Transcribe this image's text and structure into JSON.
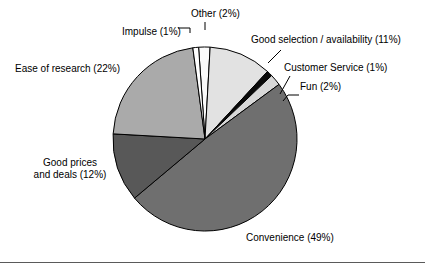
{
  "figure": {
    "background_color": "#ffffff",
    "has_footer_rule": true,
    "footer_rule_color": "#5a5a5a"
  },
  "chart_data": {
    "type": "pie",
    "title": "",
    "xlabel": "",
    "ylabel": "",
    "legend_position": "none",
    "grid": false,
    "label_format": "{name} ({value}%)",
    "total": 100,
    "start_angle_deg": -4,
    "direction": "clockwise",
    "center": {
      "x": 205,
      "y": 139
    },
    "radius": 92,
    "categories": [
      "Other",
      "Good selection / availability",
      "Customer Service",
      "Fun",
      "Convenience",
      "Good prices and deals",
      "Ease of research",
      "Impulse"
    ],
    "values": [
      2,
      11,
      1,
      2,
      49,
      12,
      22,
      1
    ],
    "colors": [
      "#fafafa",
      "#e2e2e2",
      "#0a0a0a",
      "#d8d8d8",
      "#6f6f6f",
      "#585858",
      "#aaaaaa",
      "#ffffff"
    ],
    "slice_edge_color": "#000000",
    "slices": [
      {
        "name": "Other",
        "value": 2,
        "color": "#fafafa",
        "label": "Other (2%)"
      },
      {
        "name": "Good selection / availability",
        "value": 11,
        "color": "#e2e2e2",
        "label": "Good selection / availability (11%)"
      },
      {
        "name": "Customer Service",
        "value": 1,
        "color": "#0a0a0a",
        "label": "Customer Service (1%)"
      },
      {
        "name": "Fun",
        "value": 2,
        "color": "#d8d8d8",
        "label": "Fun (2%)"
      },
      {
        "name": "Convenience",
        "value": 49,
        "color": "#6f6f6f",
        "label": "Convenience (49%)"
      },
      {
        "name": "Good prices and deals",
        "value": 12,
        "color": "#585858",
        "label": "Good prices and deals (12%)"
      },
      {
        "name": "Ease of research",
        "value": 22,
        "color": "#aaaaaa",
        "label": "Ease of research (22%)"
      },
      {
        "name": "Impulse",
        "value": 1,
        "color": "#ffffff",
        "label": "Impulse (1%)"
      }
    ]
  },
  "labels": {
    "impulse": "Impulse (1%)",
    "other": "Other (2%)",
    "good_selection": "Good selection / availability (11%)",
    "customer_service": "Customer Service (1%)",
    "fun": "Fun (2%)",
    "ease_of_research": "Ease of research (22%)",
    "good_prices_line1": "Good prices",
    "good_prices_line2": "and deals (12%)",
    "convenience": "Convenience (49%)"
  }
}
